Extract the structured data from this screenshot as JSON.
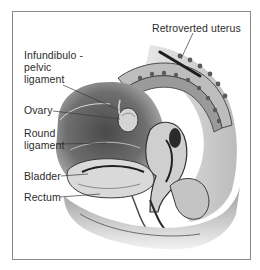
{
  "figure": {
    "labels": [
      {
        "id": "retroverted-uterus",
        "text": "Retroverted uterus"
      },
      {
        "id": "infundibulopelvic-ligament",
        "lines": [
          "Infundibulo -",
          "pelvic",
          "ligament"
        ]
      },
      {
        "id": "ovary",
        "text": "Ovary"
      },
      {
        "id": "round-ligament",
        "lines": [
          "Round",
          "ligament"
        ]
      },
      {
        "id": "bladder",
        "text": "Bladder"
      },
      {
        "id": "rectum",
        "text": "Rectum"
      }
    ],
    "colors": {
      "border": "#8a8a8a",
      "text": "#2b2b2b",
      "tissue_dark": "#3a3a3a",
      "tissue_mid": "#8c8c8c",
      "tissue_light": "#d6d6d6"
    }
  }
}
